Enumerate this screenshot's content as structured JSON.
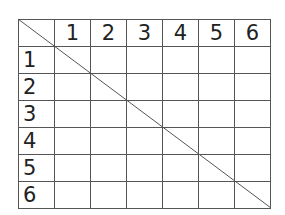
{
  "grid": {
    "corner": "",
    "columns": [
      "1",
      "2",
      "3",
      "4",
      "5",
      "6"
    ],
    "rows": [
      "1",
      "2",
      "3",
      "4",
      "5",
      "6"
    ],
    "cells": [
      [
        "",
        "",
        "",
        "",
        "",
        ""
      ],
      [
        "",
        "",
        "",
        "",
        "",
        ""
      ],
      [
        "",
        "",
        "",
        "",
        "",
        ""
      ],
      [
        "",
        "",
        "",
        "",
        "",
        ""
      ],
      [
        "",
        "",
        "",
        "",
        "",
        ""
      ],
      [
        "",
        "",
        "",
        "",
        "",
        ""
      ]
    ],
    "line_color": "#555555",
    "text_color": "#222222"
  },
  "diagonal": {
    "from": [
      18,
      19
    ],
    "to": [
      271,
      208
    ]
  }
}
